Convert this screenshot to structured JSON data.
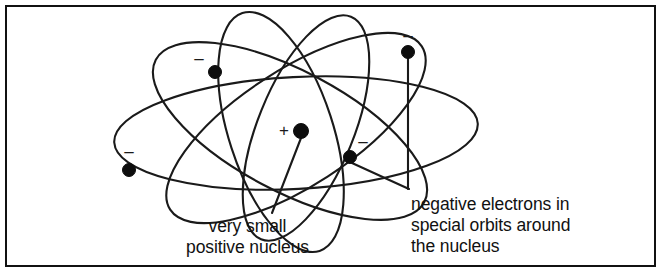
{
  "figure": {
    "background_color": "#ffffff",
    "ink_color": "#111111",
    "frame": {
      "x": 5,
      "y": 5,
      "width": 650,
      "height": 261
    }
  },
  "nucleus": {
    "label_sign": "+",
    "sign_x": 284,
    "sign_y": 131,
    "dot_x": 301,
    "dot_y": 131,
    "radius": 7.5
  },
  "electrons": [
    {
      "id": "electron-upper-left",
      "sign": "–",
      "sign_x": 199,
      "sign_y": 59,
      "dot_x": 215,
      "dot_y": 72,
      "radius": 6.5
    },
    {
      "id": "electron-top-right",
      "sign": "–",
      "sign_x": 408,
      "sign_y": 36,
      "dot_x": 408,
      "dot_y": 52,
      "radius": 6.5
    },
    {
      "id": "electron-left",
      "sign": "–",
      "sign_x": 129,
      "sign_y": 152,
      "dot_x": 129,
      "dot_y": 170,
      "radius": 6.5
    },
    {
      "id": "electron-right-inner",
      "sign": "–",
      "sign_x": 363,
      "sign_y": 142,
      "dot_x": 350,
      "dot_y": 157,
      "radius": 6.5
    }
  ],
  "captions": {
    "left": {
      "name": "nucleus-caption",
      "lines": [
        "very small",
        "positive nucleus"
      ],
      "text": "very small\npositive nucleus"
    },
    "right": {
      "name": "electrons-caption",
      "lines": [
        "negative electrons in",
        "special orbits around",
        "the nucleus"
      ],
      "text": "negative electrons in\nspecial orbits around\nthe nucleus"
    }
  },
  "leaders": [
    {
      "id": "leader-nucleus",
      "from_x": 301,
      "from_y": 138,
      "to_x": 272,
      "to_y": 213
    },
    {
      "id": "leader-electron-diagonal",
      "from_x": 352,
      "from_y": 163,
      "to_x": 409,
      "to_y": 189
    },
    {
      "id": "leader-electron-vertical",
      "from_x": 408,
      "from_y": 56,
      "to_x": 408,
      "to_y": 189
    }
  ],
  "orbits": [
    {
      "id": "orbit-horizontal-wide",
      "cx": 296,
      "cy": 133,
      "rx": 182,
      "ry": 56,
      "rotation": -3
    },
    {
      "id": "orbit-tilted-left",
      "cx": 290,
      "cy": 131,
      "rx": 152,
      "ry": 60,
      "rotation": 28
    },
    {
      "id": "orbit-tilted-right",
      "cx": 296,
      "cy": 128,
      "rx": 150,
      "ry": 58,
      "rotation": -33
    },
    {
      "id": "orbit-steep-a",
      "cx": 281,
      "cy": 132,
      "rx": 125,
      "ry": 52,
      "rotation": 72
    },
    {
      "id": "orbit-steep-b",
      "cx": 306,
      "cy": 128,
      "rx": 120,
      "ry": 48,
      "rotation": -68
    }
  ]
}
